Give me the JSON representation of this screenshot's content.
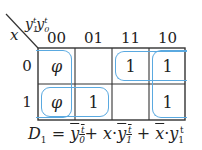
{
  "kmap": {
    "row_var": "x",
    "col_vars": "y1t y0t",
    "col_var_1": "y",
    "col_var_1_sub": "1",
    "col_var_1_sup": "t",
    "col_var_2": "y",
    "col_var_2_sub": "0",
    "col_var_2_sup": "t",
    "col_headers": [
      "00",
      "01",
      "11",
      "10"
    ],
    "row_headers": [
      "0",
      "1"
    ],
    "cells": [
      [
        "φ",
        "",
        "1",
        "1"
      ],
      [
        "φ",
        "1",
        "",
        "1"
      ]
    ],
    "group_color": "#5aa9e0",
    "groups": [
      {
        "name": "y0-bar (cols 00 & 10, wrap-around)",
        "cells": [
          [
            0,
            0
          ],
          [
            1,
            0
          ],
          [
            0,
            3
          ],
          [
            1,
            3
          ]
        ]
      },
      {
        "name": "x·y1-bar",
        "cells": [
          [
            1,
            0
          ],
          [
            1,
            1
          ]
        ]
      },
      {
        "name": "x-bar·y1",
        "cells": [
          [
            0,
            2
          ],
          [
            0,
            3
          ]
        ]
      }
    ]
  },
  "formula": {
    "lhs": "D",
    "lhs_sub": "1",
    "eq": "=",
    "t1_var": "y",
    "t1_sub": "0",
    "t1_sup": "t",
    "plus1": "+",
    "t2_x": "x",
    "dot": "·",
    "t2_var": "y",
    "t2_sub": "1",
    "t2_sup": "t",
    "plus2": "+",
    "t3_x": "x",
    "t3_var": "y",
    "t3_sub": "1",
    "t3_sup": "t",
    "text": "D1 = y0t-bar + x·y1t-bar + x-bar·y1t"
  }
}
